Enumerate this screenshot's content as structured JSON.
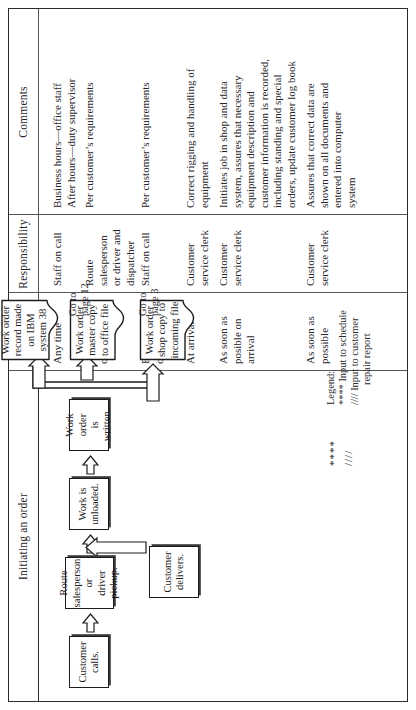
{
  "document": {
    "orientation": "rotated-90-ccw",
    "kind": "procedure-flow-table"
  },
  "table": {
    "columns": [
      {
        "id": "initiating",
        "label": "Initiating an order"
      },
      {
        "id": "frequency",
        "label": "Frequency"
      },
      {
        "id": "responsibility",
        "label": "Responsibility"
      },
      {
        "id": "comments",
        "label": "Comments"
      }
    ],
    "rows": [
      {
        "step": "Customer calls.",
        "frequency": [
          "Any time"
        ],
        "responsibility": [
          "Staff on call"
        ],
        "comments": [
          "Business hours—office staff",
          "After hours—duty supervisor"
        ]
      },
      {
        "step": "Route salesperson or driver pickup.",
        "frequency": [
          "Per schedule",
          "or callout"
        ],
        "responsibility": [
          "Route",
          "salesperson",
          "or driver and",
          "dispatcher"
        ],
        "comments": [
          "Per customer’s requirements"
        ]
      },
      {
        "step": "Customer delivers.",
        "frequency": [
          "Business hour",
          "or by request"
        ],
        "responsibility": [
          "Staff on call"
        ],
        "comments": [
          "Per customer’s requirements"
        ]
      },
      {
        "step": "Work is unloaded.",
        "frequency": [
          "At arrival"
        ],
        "responsibility": [
          "Customer",
          "service clerk"
        ],
        "comments": [
          "Correct rigging and handling of",
          "equipment"
        ]
      },
      {
        "step": "Work order is written.",
        "frequency": [
          "As soon as",
          "posible on",
          "arrival"
        ],
        "responsibility": [
          "Customer",
          "service clerk"
        ],
        "comments": [
          "Initiates job in shop and data",
          "system, assures that necessary",
          "equipment description and",
          "customer information is recorded,",
          "including standing and special",
          "orders, update customer log book"
        ]
      },
      {
        "step": "Work order distribution.",
        "frequency": [
          "As soon as",
          "possible"
        ],
        "responsibility": [
          "Customer",
          "service clerk"
        ],
        "comments": [
          "Assures that correct data are",
          "shown on all documents and",
          "entered into computer",
          "system"
        ]
      }
    ]
  },
  "flow": {
    "process_nodes": [
      {
        "id": "customer-calls",
        "lines": [
          "Customer",
          "calls."
        ]
      },
      {
        "id": "route-pickup",
        "lines": [
          "Route",
          "salesperson or",
          "driver pickup."
        ]
      },
      {
        "id": "customer-delivers",
        "lines": [
          "Customer",
          "delivers."
        ]
      },
      {
        "id": "work-unloaded",
        "lines": [
          "Work is",
          "unloaded."
        ]
      },
      {
        "id": "work-order-written",
        "lines": [
          "Work order",
          "is written."
        ]
      }
    ],
    "document_nodes": [
      {
        "id": "shop-copy",
        "lines": [
          "Work order",
          "shop copy",
          "to incoming",
          "file"
        ],
        "goto": "Go to\npage 3",
        "goto_line1": "Go to",
        "goto_line2": "page 3"
      },
      {
        "id": "master-copy",
        "lines": [
          "Work order",
          "master copy",
          "to office",
          "file"
        ],
        "goto_line1": "Go to",
        "goto_line2": "page 12"
      },
      {
        "id": "ibm-record",
        "lines": [
          "Work order",
          "record made",
          "on IBM",
          "system 38"
        ],
        "goto_line1": "",
        "goto_line2": ""
      }
    ]
  },
  "markers": {
    "asterisks": "****",
    "slashes": "////"
  },
  "legend": {
    "title": "Legend:",
    "entries": [
      {
        "symbol": "****",
        "text": "Input to schedule"
      },
      {
        "symbol": "////",
        "text": "Input to customer",
        "text2": "repair report"
      }
    ],
    "line1": "**** Input to schedule",
    "line2": "//// Input to customer",
    "line3": "repair report"
  },
  "colors": {
    "ink": "#26262a",
    "rule": "#55555a",
    "frame": "#2b2b2b",
    "paper": "#ffffff"
  }
}
